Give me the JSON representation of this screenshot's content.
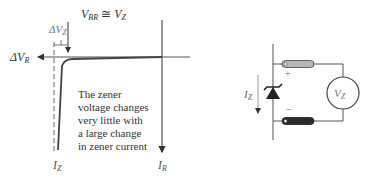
{
  "graph": {
    "vbr_label": {
      "main": "V",
      "sub": "BR",
      "approx": " ≅ ",
      "main2": "V",
      "sub2": "Z"
    },
    "delta_vz_label": {
      "main": "ΔV",
      "sub": "Z"
    },
    "delta_vr_label": {
      "main": "ΔV",
      "sub": "R"
    },
    "iz_label": {
      "main": "I",
      "sub": "Z"
    },
    "ir_label": {
      "main": "I",
      "sub": "R"
    },
    "note_lines": [
      "The zener",
      "voltage changes",
      "very little with",
      "a large change",
      "in zener current"
    ]
  },
  "circuit": {
    "current_label": {
      "main": "I",
      "sub": "Z"
    },
    "meter_label": {
      "main": "V",
      "sub": "Z"
    },
    "plus_sign": "+",
    "minus_sign": "−",
    "probe_colors": {
      "positive": "#b8b8b8",
      "negative": "#2a2a2a"
    }
  }
}
